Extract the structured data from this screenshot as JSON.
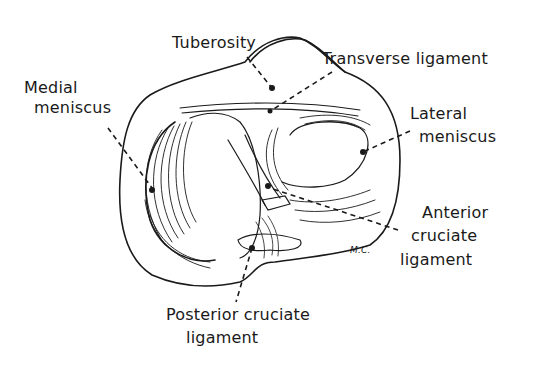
{
  "diagram": {
    "signature": "M.C.",
    "labels": {
      "tuberosity": "Tuberosity",
      "transverse_ligament": "Transverse ligament",
      "medial_meniscus_line1": "Medial",
      "medial_meniscus_line2": "meniscus",
      "lateral_meniscus_line1": "Lateral",
      "lateral_meniscus_line2": "meniscus",
      "anterior_cruciate_line1": "Anterior",
      "anterior_cruciate_line2": "cruciate",
      "anterior_cruciate_line3": "ligament",
      "posterior_cruciate_line1": "Posterior cruciate",
      "posterior_cruciate_line2": "ligament"
    },
    "colors": {
      "ink": "#1a1a1a",
      "background": "#ffffff"
    }
  }
}
